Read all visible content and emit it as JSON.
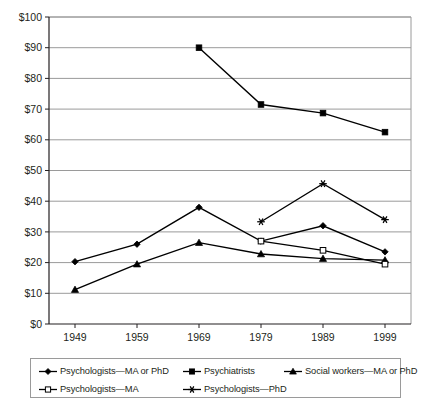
{
  "chart_data": {
    "type": "line",
    "title": "",
    "subtitle": "",
    "xlabel": "",
    "ylabel": "",
    "x": [
      1949,
      1959,
      1969,
      1979,
      1989,
      1999
    ],
    "categories": [
      "1949",
      "1959",
      "1969",
      "1979",
      "1989",
      "1999"
    ],
    "xtick_labels": [
      "1949",
      "1959",
      "1969",
      "1979",
      "1989",
      "1999"
    ],
    "ytick_labels": [
      "$0",
      "$10",
      "$20",
      "$30",
      "$40",
      "$50",
      "$60",
      "$70",
      "$80",
      "$90",
      "$100"
    ],
    "ytick_values": [
      0,
      10,
      20,
      30,
      40,
      50,
      60,
      70,
      80,
      90,
      100
    ],
    "ylim": [
      0,
      100
    ],
    "xlim": [
      1944,
      2004
    ],
    "grid": "horizontal",
    "legend_position": "bottom",
    "series": [
      {
        "name": "Psychologists—MA or PhD",
        "marker": "filled-diamond",
        "color": "#000000",
        "values": [
          20.3,
          26.0,
          38.0,
          27.0,
          32.0,
          23.5
        ]
      },
      {
        "name": "Psychiatrists",
        "marker": "filled-square",
        "color": "#000000",
        "values": [
          null,
          null,
          90.0,
          71.5,
          68.7,
          62.5
        ]
      },
      {
        "name": "Social workers—MA or PhD",
        "marker": "filled-triangle",
        "color": "#000000",
        "values": [
          11.2,
          19.5,
          26.5,
          22.8,
          21.3,
          20.8
        ]
      },
      {
        "name": "Psychologists—MA",
        "marker": "open-square",
        "color": "#000000",
        "values": [
          null,
          null,
          null,
          27.0,
          24.0,
          19.5
        ]
      },
      {
        "name": "Psychologists—PhD",
        "marker": "asterisk",
        "color": "#000000",
        "values": [
          null,
          null,
          null,
          33.3,
          45.7,
          34.0
        ]
      }
    ]
  },
  "legend": {
    "rows": [
      [
        {
          "label": "Psychologists—MA or PhD",
          "marker": "filled-diamond"
        },
        {
          "label": "Psychiatrists",
          "marker": "filled-square"
        },
        {
          "label": "Social workers—MA or PhD",
          "marker": "filled-triangle"
        }
      ],
      [
        {
          "label": "Psychologists—MA",
          "marker": "open-square"
        },
        {
          "label": "Psychologists—PhD",
          "marker": "asterisk"
        }
      ]
    ]
  },
  "colors": {
    "axis": "#231f20",
    "gridline": "#9a9a9a",
    "series": "#000000",
    "plot_background": "#ffffff"
  },
  "caption": ""
}
